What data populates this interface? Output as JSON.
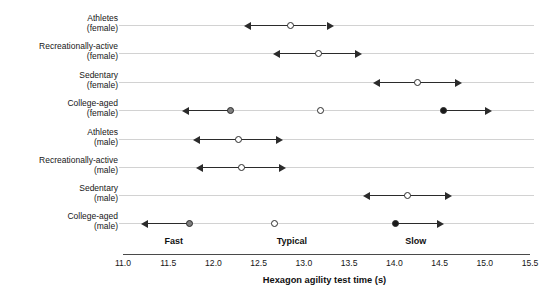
{
  "chart_data": {
    "type": "scatter",
    "title": "",
    "xlabel": "Hexagon agility test time (s)",
    "ylabel": "",
    "xlim": [
      11.0,
      15.5
    ],
    "xticks": [
      "11.0",
      "11.5",
      "12.0",
      "12.5",
      "13.0",
      "13.5",
      "14.0",
      "14.5",
      "15.0",
      "15.5"
    ],
    "xtick_values": [
      11.0,
      11.5,
      12.0,
      12.5,
      13.0,
      13.5,
      14.0,
      14.5,
      15.0,
      15.5
    ],
    "grid": false,
    "legend": "none",
    "categories": [
      {
        "line1": "Athletes",
        "line2": "(female)"
      },
      {
        "line1": "Recreationally-active",
        "line2": "(female)"
      },
      {
        "line1": "Sedentary",
        "line2": "(female)"
      },
      {
        "line1": "College-aged",
        "line2": "(female)"
      },
      {
        "line1": "Athletes",
        "line2": "(male)"
      },
      {
        "line1": "Recreationally-active",
        "line2": "(male)"
      },
      {
        "line1": "Sedentary",
        "line2": "(male)"
      },
      {
        "line1": "College-aged",
        "line2": "(male)"
      }
    ],
    "zone_annotations": [
      {
        "label": "Fast",
        "x": 11.46
      },
      {
        "label": "Typical",
        "x": 12.7
      },
      {
        "label": "Slow",
        "x": 14.12
      }
    ],
    "rows": [
      {
        "category": "Athletes (female)",
        "points": [
          {
            "value": 12.85,
            "style": "open",
            "range_low": 12.41,
            "range_high": 13.25,
            "arrow_left": true,
            "arrow_right": true
          }
        ]
      },
      {
        "category": "Recreationally-active (female)",
        "points": [
          {
            "value": 13.16,
            "style": "open",
            "range_low": 12.74,
            "range_high": 13.57,
            "arrow_left": true,
            "arrow_right": true
          }
        ]
      },
      {
        "category": "Sedentary (female)",
        "points": [
          {
            "value": 14.26,
            "style": "open",
            "range_low": 13.84,
            "range_high": 14.67,
            "arrow_left": true,
            "arrow_right": true
          }
        ]
      },
      {
        "category": "College-aged (female)",
        "points": [
          {
            "value": 12.19,
            "style": "gray",
            "range_low": 11.73,
            "range_high": 12.19,
            "arrow_left": true,
            "arrow_right": false
          },
          {
            "value": 13.18,
            "style": "open",
            "range_low": 13.18,
            "range_high": 13.18,
            "arrow_left": false,
            "arrow_right": false
          },
          {
            "value": 14.54,
            "style": "filled",
            "range_low": 14.54,
            "range_high": 15.0,
            "arrow_left": false,
            "arrow_right": true
          }
        ]
      },
      {
        "category": "Athletes (male)",
        "points": [
          {
            "value": 12.28,
            "style": "open",
            "range_low": 11.85,
            "range_high": 12.69,
            "arrow_left": true,
            "arrow_right": true
          }
        ]
      },
      {
        "category": "Recreationally-active (male)",
        "points": [
          {
            "value": 12.31,
            "style": "open",
            "range_low": 11.88,
            "range_high": 12.72,
            "arrow_left": true,
            "arrow_right": true
          }
        ]
      },
      {
        "category": "Sedentary (male)",
        "points": [
          {
            "value": 14.15,
            "style": "open",
            "range_low": 13.73,
            "range_high": 14.56,
            "arrow_left": true,
            "arrow_right": true
          }
        ]
      },
      {
        "category": "College-aged (male)",
        "points": [
          {
            "value": 11.74,
            "style": "gray",
            "range_low": 11.28,
            "range_high": 11.74,
            "arrow_left": true,
            "arrow_right": false
          },
          {
            "value": 12.67,
            "style": "open",
            "range_low": 12.67,
            "range_high": 12.67,
            "arrow_left": false,
            "arrow_right": false
          },
          {
            "value": 14.01,
            "style": "filled",
            "range_low": 14.01,
            "range_high": 14.47,
            "arrow_left": false,
            "arrow_right": true
          }
        ]
      }
    ]
  }
}
